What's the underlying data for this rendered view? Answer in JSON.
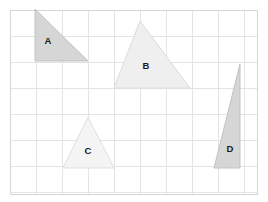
{
  "figure": {
    "kind": "geometry-grid-triangles",
    "canvas": {
      "width": 268,
      "height": 202,
      "background": "#ffffff"
    },
    "grid": {
      "x": 10,
      "y": 10,
      "width": 247,
      "height": 184,
      "cell_size": 26,
      "columns": 9,
      "rows": 7,
      "line_color": "#e3e3e8",
      "border_color": "#d5d5dc",
      "cell_fill": "#ffffff"
    },
    "shapes": [
      {
        "label": "A",
        "name": "triangle-a",
        "points": "35,9 35,61 88,61",
        "fill": "#d6d6d6",
        "stroke": "#c2c2c2",
        "label_x": 48,
        "label_y": 41
      },
      {
        "label": "B",
        "name": "triangle-b",
        "points": "140,21 114,88 190,88",
        "fill": "#efefef",
        "stroke": "#dcdcdc",
        "label_x": 146,
        "label_y": 66
      },
      {
        "label": "C",
        "name": "triangle-c",
        "points": "88,117 63,168 114,168",
        "fill": "#f4f4f4",
        "stroke": "#e0e0e0",
        "label_x": 88,
        "label_y": 151
      },
      {
        "label": "D",
        "name": "triangle-d",
        "points": "240,64 214,168 240,168",
        "fill": "#d6d6d6",
        "stroke": "#c2c2c2",
        "label_x": 230,
        "label_y": 149
      }
    ]
  }
}
